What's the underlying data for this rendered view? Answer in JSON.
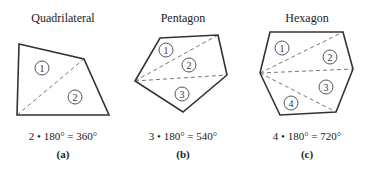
{
  "figures": [
    {
      "id": "a",
      "title": "Quadrilateral",
      "equation": "2 • 180° = 360°",
      "label": "(a)",
      "sides": 4,
      "triangles": 2,
      "vertices": [
        [
          19,
          44
        ],
        [
          84,
          59
        ],
        [
          109,
          115
        ],
        [
          17,
          115
        ]
      ],
      "diagonals": [
        [
          [
            17,
            115
          ],
          [
            84,
            59
          ]
        ]
      ],
      "regions": [
        {
          "n": "1",
          "x": 42,
          "y": 68
        },
        {
          "n": "2",
          "x": 75,
          "y": 97
        }
      ],
      "title_x": 63,
      "text_x": 63
    },
    {
      "id": "b",
      "title": "Pentagon",
      "equation": "3 • 180° = 540°",
      "label": "(b)",
      "sides": 5,
      "triangles": 3,
      "vertices": [
        [
          160,
          38
        ],
        [
          218,
          35
        ],
        [
          227,
          75
        ],
        [
          183,
          112
        ],
        [
          135,
          81
        ]
      ],
      "diagonals": [
        [
          [
            135,
            81
          ],
          [
            218,
            35
          ]
        ],
        [
          [
            135,
            81
          ],
          [
            227,
            75
          ]
        ]
      ],
      "regions": [
        {
          "n": "1",
          "x": 166,
          "y": 50
        },
        {
          "n": "2",
          "x": 189,
          "y": 65
        },
        {
          "n": "3",
          "x": 182,
          "y": 94
        }
      ],
      "title_x": 183,
      "text_x": 183
    },
    {
      "id": "c",
      "title": "Hexagon",
      "equation": "4 • 180° = 720°",
      "label": "(c)",
      "sides": 6,
      "triangles": 4,
      "vertices": [
        [
          270,
          32
        ],
        [
          343,
          32
        ],
        [
          353,
          69
        ],
        [
          336,
          112
        ],
        [
          280,
          115
        ],
        [
          260,
          73
        ]
      ],
      "diagonals": [
        [
          [
            260,
            73
          ],
          [
            343,
            32
          ]
        ],
        [
          [
            260,
            73
          ],
          [
            353,
            69
          ]
        ],
        [
          [
            260,
            73
          ],
          [
            336,
            112
          ]
        ]
      ],
      "regions": [
        {
          "n": "1",
          "x": 282,
          "y": 48
        },
        {
          "n": "2",
          "x": 330,
          "y": 57
        },
        {
          "n": "3",
          "x": 326,
          "y": 87
        },
        {
          "n": "4",
          "x": 291,
          "y": 103
        }
      ],
      "title_x": 307,
      "text_x": 307
    }
  ]
}
